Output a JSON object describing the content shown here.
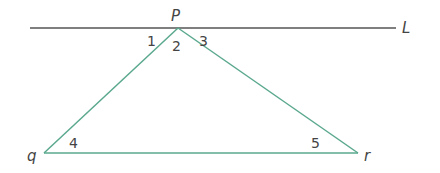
{
  "diagram": {
    "type": "geometry",
    "line": {
      "label": "L",
      "color": "#555555"
    },
    "triangle": {
      "color": "#5aa88e",
      "vertices": [
        {
          "name": "P",
          "x": 178,
          "y": 28
        },
        {
          "name": "q",
          "x": 44,
          "y": 153
        },
        {
          "name": "r",
          "x": 358,
          "y": 153
        }
      ]
    },
    "angles": [
      {
        "label": "1",
        "position": "left of P, between L and Pq"
      },
      {
        "label": "2",
        "position": "at P, inside triangle"
      },
      {
        "label": "3",
        "position": "right of P, between L and Pr"
      },
      {
        "label": "4",
        "position": "at q, inside triangle"
      },
      {
        "label": "5",
        "position": "at r, inside triangle"
      }
    ],
    "labels": {
      "P": "P",
      "L": "L",
      "q": "q",
      "r": "r",
      "a1": "1",
      "a2": "2",
      "a3": "3",
      "a4": "4",
      "a5": "5"
    }
  }
}
